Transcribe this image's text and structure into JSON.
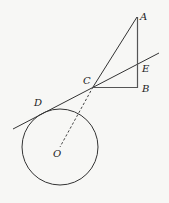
{
  "diagram": {
    "background": "#f7f7f5",
    "stroke_color": "#333333",
    "points": {
      "A": {
        "label": "A",
        "x": 137,
        "y": 17
      },
      "B": {
        "label": "B",
        "x": 138,
        "y": 88
      },
      "C": {
        "label": "C",
        "x": 93,
        "y": 87
      },
      "D": {
        "label": "D",
        "x": 43,
        "y": 113
      },
      "E": {
        "label": "E",
        "x": 138,
        "y": 63
      },
      "O": {
        "label": "O",
        "x": 60,
        "y": 147
      }
    },
    "circle": {
      "center": "O",
      "radius": 38
    },
    "segments": [
      {
        "from": "A",
        "to": "B",
        "style": "solid"
      },
      {
        "from": "A",
        "to": "C",
        "style": "solid"
      },
      {
        "from": "C",
        "to": "B",
        "style": "solid"
      },
      {
        "from": "C",
        "to": "O",
        "style": "dashed"
      }
    ],
    "tangent_line": {
      "from": [
        13,
        129
      ],
      "to": [
        159,
        53
      ],
      "touches": "D",
      "passes_through": [
        "C",
        "E"
      ]
    }
  }
}
